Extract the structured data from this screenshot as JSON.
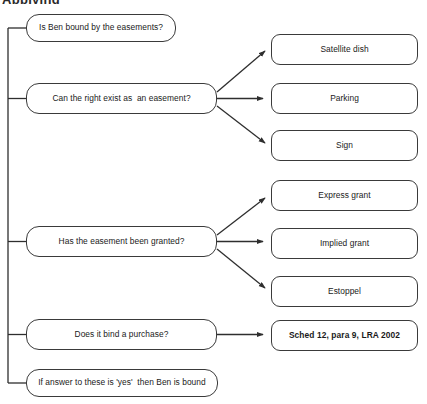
{
  "heading": {
    "text": "Applying"
  },
  "diagram": {
    "type": "flowchart",
    "orientation": "left-to-right",
    "spine": {
      "name": "left-vertical-spine",
      "x": 8,
      "y_top": 28,
      "y_bottom": 383
    },
    "questions": [
      {
        "id": "q-bound",
        "label": "Is Ben bound by the easements?",
        "x": 26,
        "y": 14,
        "width": 150,
        "height": 28
      },
      {
        "id": "q-exist",
        "label": "Can the right exist as  an easement?",
        "x": 26,
        "y": 83,
        "width": 191,
        "height": 31
      },
      {
        "id": "q-granted",
        "label": "Has the easement been granted?",
        "x": 26,
        "y": 226,
        "width": 191,
        "height": 31
      },
      {
        "id": "q-purchase",
        "label": "Does it bind a purchase?",
        "x": 26,
        "y": 319,
        "width": 191,
        "height": 31
      },
      {
        "id": "q-conclusion",
        "label": "If answer to these is 'yes'  then Ben is bound",
        "x": 26,
        "y": 369,
        "width": 192,
        "height": 28
      }
    ],
    "outcomes": [
      {
        "id": "o-satellite",
        "label": "Satellite dish",
        "parent": "q-exist",
        "x": 271,
        "y": 34,
        "width": 147,
        "height": 31,
        "bold": false
      },
      {
        "id": "o-parking",
        "label": "Parking",
        "parent": "q-exist",
        "x": 271,
        "y": 83,
        "width": 147,
        "height": 31,
        "bold": false
      },
      {
        "id": "o-sign",
        "label": "Sign",
        "parent": "q-exist",
        "x": 271,
        "y": 130,
        "width": 147,
        "height": 31,
        "bold": false
      },
      {
        "id": "o-express",
        "label": "Express grant",
        "parent": "q-granted",
        "x": 271,
        "y": 180,
        "width": 147,
        "height": 31,
        "bold": false
      },
      {
        "id": "o-implied",
        "label": "Implied grant",
        "parent": "q-granted",
        "x": 271,
        "y": 228,
        "width": 147,
        "height": 31,
        "bold": false
      },
      {
        "id": "o-estoppel",
        "label": "Estoppel",
        "parent": "q-granted",
        "x": 271,
        "y": 276,
        "width": 147,
        "height": 31,
        "bold": false
      },
      {
        "id": "o-statute",
        "label": "Sched 12, para 9, LRA 2002",
        "parent": "q-purchase",
        "x": 271,
        "y": 320,
        "width": 147,
        "height": 31,
        "bold": true
      }
    ],
    "colors": {
      "border": "#3a3a3a",
      "connector": "#2e2e2e",
      "text": "#1a1a1a",
      "background": "#ffffff"
    }
  }
}
